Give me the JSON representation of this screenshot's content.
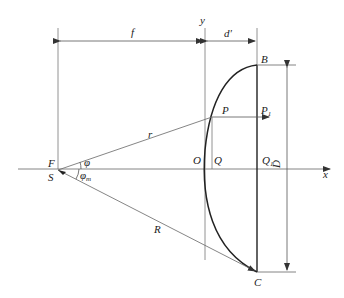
{
  "diagram": {
    "colors": {
      "line": "#555555",
      "curve": "#222222",
      "background": "#ffffff"
    },
    "labels": {
      "f": "f",
      "d": "d'",
      "y_axis": "y",
      "x_axis": "x",
      "B": "B",
      "C": "C",
      "P": "P",
      "P1": "P",
      "P1_sub": "1",
      "Q": "Q",
      "Q1": "Q",
      "Q1_sub": "1",
      "O": "O",
      "F": "F",
      "S": "S",
      "r": "r",
      "R": "R",
      "D": "D",
      "phi": "φ",
      "phi_m": "φ",
      "phi_m_sub": "m"
    }
  }
}
